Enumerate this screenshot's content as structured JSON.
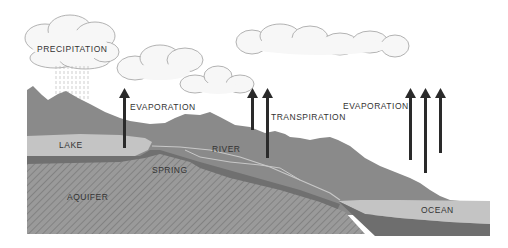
{
  "diagram": {
    "type": "water-cycle",
    "labels": {
      "precipitation": "PRECIPITATION",
      "evaporation_lake": "EVAPORATION",
      "transpiration": "TRANSPIRATION",
      "evaporation_ocean": "EVAPORATION",
      "lake": "LAKE",
      "river": "RIVER",
      "spring": "SPRING",
      "aquifer": "AQUIFER",
      "ocean": "OCEAN"
    },
    "colors": {
      "background": "#ffffff",
      "land": "#8a8a8a",
      "water": "#c4c4c4",
      "aquifer": "#9a9a9a",
      "aquifer_hatch": "#7a7a7a",
      "deep_layer": "#6e6e6e",
      "arrow": "#2a2a2a",
      "cloud": "#f7f7f7",
      "cloud_outline": "#9a9a9a"
    },
    "arrows": [
      {
        "name": "evaporation-lake",
        "count": 1
      },
      {
        "name": "transpiration",
        "count": 2
      },
      {
        "name": "evaporation-ocean",
        "count": 3
      }
    ]
  }
}
